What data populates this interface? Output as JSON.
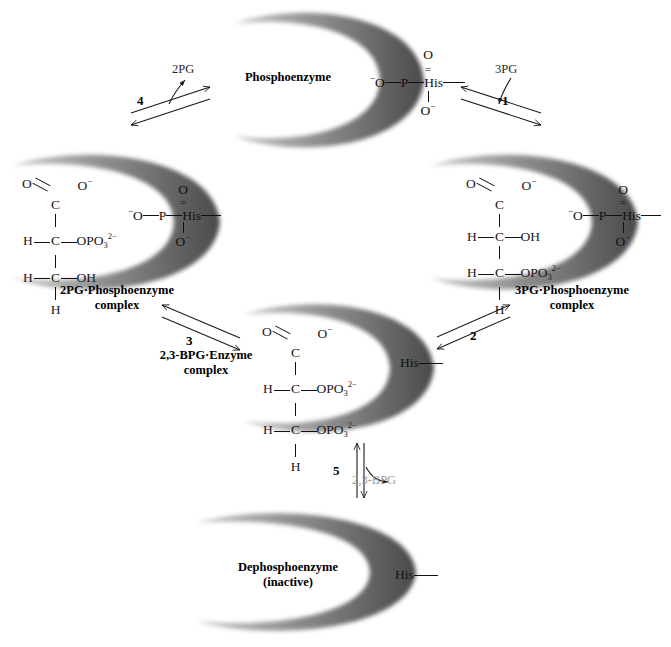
{
  "diagram": {
    "title_hidden": "Phosphoglycerate mutase reaction cycle",
    "pockets": [
      {
        "id": "phosphoenzyme",
        "label": "Phosphoenzyme"
      },
      {
        "id": "pg3_complex",
        "label": "3PG·Phosphoenzyme\ncomplex"
      },
      {
        "id": "bpg_complex",
        "label": "2,3-BPG·Enzyme\ncomplex"
      },
      {
        "id": "pg2_complex",
        "label": "2PG·Phosphoenzyme\ncomplex"
      },
      {
        "id": "dephospho",
        "label": "Dephosphoenzyme\n(inactive)"
      }
    ],
    "captions": {
      "phosphoenzyme": "Phosphoenzyme",
      "pg3_line1": "3PG·Phosphoenzyme",
      "pg3_line2": "complex",
      "pg2_line1": "2PG·Phosphoenzyme",
      "pg2_line2": "complex",
      "bpg_line1": "2,3-BPG·Enzyme",
      "bpg_line2": "complex",
      "dephospho_line1": "Dephosphoenzyme",
      "dephospho_line2": "(inactive)"
    },
    "steps": [
      {
        "number": "1",
        "substrate": "3PG",
        "direction": "in",
        "color": "#1a1a1a"
      },
      {
        "number": "2",
        "substrate": "",
        "direction": "",
        "color": "#1a1a1a"
      },
      {
        "number": "3",
        "substrate": "",
        "direction": "",
        "color": "#1a1a1a"
      },
      {
        "number": "4",
        "substrate": "2PG",
        "direction": "out",
        "color": "#1a1a1a"
      },
      {
        "number": "5",
        "substrate": "2,3-BPG",
        "direction": "out",
        "color": "#9a9a9a"
      }
    ],
    "step_numbers": {
      "s1": "1",
      "s2": "2",
      "s3": "3",
      "s4": "4",
      "s5": "5"
    },
    "substrate_labels": {
      "pg3": "3PG",
      "pg2": "2PG",
      "bpg": "2,3-BPG"
    },
    "residue": {
      "his": "His"
    },
    "phosphoryl_group": {
      "top_o": "O",
      "left_o": "O",
      "left_charge": "−",
      "p": "P",
      "bottom_o": "O",
      "bottom_charge": "−",
      "his": "His"
    },
    "structures": {
      "pg2": {
        "name": "2-phosphoglycerate",
        "c1_o": "O",
        "c1_c": "C",
        "c1_om": "O",
        "c1_charge": "−",
        "c2_h": "H",
        "c2_c": "C",
        "c2_group": "OPO",
        "c2_sub": "3",
        "c2_sup": "2−",
        "c3_h": "H",
        "c3_c": "C",
        "c3_group": "OH",
        "c3_h2": "H"
      },
      "pg3": {
        "name": "3-phosphoglycerate",
        "c1_o": "O",
        "c1_c": "C",
        "c1_om": "O",
        "c1_charge": "−",
        "c2_h": "H",
        "c2_c": "C",
        "c2_group": "OH",
        "c3_h": "H",
        "c3_c": "C",
        "c3_group": "OPO",
        "c3_sub": "3",
        "c3_sup": "2−",
        "c3_h2": "H"
      },
      "bpg": {
        "name": "2,3-bisphosphoglycerate",
        "c1_o": "O",
        "c1_c": "C",
        "c1_om": "O",
        "c1_charge": "−",
        "c2_h": "H",
        "c2_c": "C",
        "c2_group": "OPO",
        "c2_sub": "3",
        "c2_sup": "2−",
        "c3_h": "H",
        "c3_c": "C",
        "c3_group": "OPO",
        "c3_sub": "3",
        "c3_sup": "2−",
        "c3_h2": "H"
      }
    },
    "colors": {
      "background": "#ffffff",
      "ink": "#1a1a1a",
      "pocket_dark": "#555555",
      "pocket_mid": "#9b9b9b",
      "gray_label": "#9a9a9a"
    }
  }
}
